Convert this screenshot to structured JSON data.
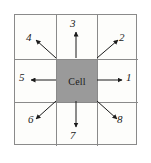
{
  "figure": {
    "name": "cell-neighborhood-diagram",
    "center_label": "Cell",
    "background_color": "#ffffff",
    "grid_line_color": "#8a8a8a",
    "cell_fill_color": "#9a9a9a",
    "arrow_color": "#1b1b1b",
    "grid": {
      "rows": 3,
      "cols": 3
    }
  },
  "directions": [
    {
      "id": "1",
      "label": "1",
      "name": "east",
      "angle_deg": 0,
      "arrow": "right"
    },
    {
      "id": "2",
      "label": "2",
      "name": "north-east",
      "angle_deg": 45,
      "arrow": "up-right"
    },
    {
      "id": "3",
      "label": "3",
      "name": "north",
      "angle_deg": 90,
      "arrow": "up"
    },
    {
      "id": "4",
      "label": "4",
      "name": "north-west",
      "angle_deg": 135,
      "arrow": "up-left"
    },
    {
      "id": "5",
      "label": "5",
      "name": "west",
      "angle_deg": 180,
      "arrow": "left"
    },
    {
      "id": "6",
      "label": "6",
      "name": "south-west",
      "angle_deg": 225,
      "arrow": "down-left"
    },
    {
      "id": "7",
      "label": "7",
      "name": "south",
      "angle_deg": 270,
      "arrow": "down"
    },
    {
      "id": "8",
      "label": "8",
      "name": "south-east",
      "angle_deg": 315,
      "arrow": "down-right"
    }
  ]
}
